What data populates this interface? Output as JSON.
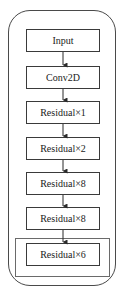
{
  "diagram": {
    "type": "flowchart",
    "direction": "top-to-bottom",
    "nodes": [
      {
        "id": "input",
        "label": "Input"
      },
      {
        "id": "conv2d",
        "label": "Conv2D"
      },
      {
        "id": "res1",
        "label": "Residual×1"
      },
      {
        "id": "res2",
        "label": "Residual×2"
      },
      {
        "id": "res8a",
        "label": "Residual×8"
      },
      {
        "id": "res8b",
        "label": "Residual×8"
      },
      {
        "id": "res6",
        "label": "Residual×6",
        "highlighted": true
      }
    ],
    "edges": [
      [
        "input",
        "conv2d"
      ],
      [
        "conv2d",
        "res1"
      ],
      [
        "res1",
        "res2"
      ],
      [
        "res2",
        "res8a"
      ],
      [
        "res8a",
        "res8b"
      ],
      [
        "res8b",
        "res6"
      ]
    ],
    "colors": {
      "stroke": "#3a3a3a",
      "background": "#ffffff",
      "text": "#1a1a1a"
    }
  }
}
